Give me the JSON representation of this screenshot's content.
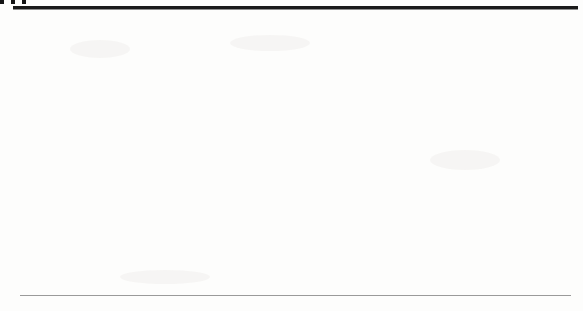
{
  "figure": {
    "type": "scanned-textbook-figure",
    "background_color": "#fdfdfc",
    "ink_color": "#4a4a4a",
    "rule_color": "#1a1a1a"
  },
  "ellipsis": {
    "glyph": "•••",
    "dot_count": 3
  },
  "annotations": {
    "line1": "Area",
    "line2": "relatively",
    "line3": "free of",
    "line4": "signals",
    "blocks": [
      {
        "id": "area-free-1",
        "x": 74,
        "y": 88
      },
      {
        "id": "area-free-2",
        "x": 135,
        "y": 108
      },
      {
        "id": "area-free-3",
        "x": 199,
        "y": 121
      },
      {
        "id": "area-free-4",
        "x": 263,
        "y": 134
      },
      {
        "id": "area-free-5",
        "x": 322,
        "y": 140
      },
      {
        "id": "area-free-6",
        "x": 379,
        "y": 153
      },
      {
        "id": "area-free-7",
        "x": 434,
        "y": 166
      },
      {
        "id": "area-free-8",
        "x": 489,
        "y": 180
      },
      {
        "id": "area-free-9",
        "x": 546,
        "y": 185
      }
    ]
  },
  "chart_data": {
    "type": "bar",
    "title": "",
    "subtitle": "",
    "xlabel": "",
    "ylabel": "",
    "grid": false,
    "legend": null,
    "categories": [
      "0",
      "fh",
      "2fh",
      "3fh",
      "4fh",
      "5fh",
      "6fh",
      "7fh",
      "8fh"
    ],
    "tick_labels": [
      {
        "main": "0",
        "italic": "",
        "sub": ""
      },
      {
        "main": "",
        "italic": "f",
        "sub": "h"
      },
      {
        "main": "2",
        "italic": "f",
        "sub": "h"
      },
      {
        "main": "3",
        "italic": "f",
        "sub": "h"
      },
      {
        "main": "4",
        "italic": "f",
        "sub": "h"
      },
      {
        "main": "5",
        "italic": "f",
        "sub": "h"
      },
      {
        "main": "6",
        "italic": "f",
        "sub": "h"
      },
      {
        "main": "7",
        "italic": "f",
        "sub": "h"
      },
      {
        "main": "8",
        "italic": "f",
        "sub": "h"
      }
    ],
    "tick_x_px": [
      37,
      102,
      167,
      231,
      294,
      350,
      406,
      460,
      512
    ],
    "values": [
      1.0,
      0.78,
      0.62,
      0.52,
      0.44,
      0.33,
      0.22,
      0.15,
      0.11
    ],
    "ylim": [
      0,
      1.0
    ],
    "xlim_px": [
      20,
      570
    ],
    "baseline_y_px": 255,
    "plot_top_y_px": 28,
    "lobe_halfwidth_px": [
      30,
      30,
      30,
      28,
      26,
      25,
      24,
      23,
      22
    ],
    "lobe_decay": 2.25,
    "bar_spacing_px": 2,
    "bar_width_px": 1,
    "bar_color": "#6f6f6f",
    "envelope_color": "#2e2e2e",
    "axis_color": "#5f5f5f"
  }
}
